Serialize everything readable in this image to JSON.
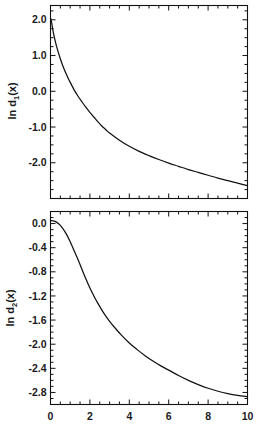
{
  "figure": {
    "title": "",
    "background": "#ffffff",
    "line_color": "#111111",
    "panels": 2
  },
  "chart_data": [
    {
      "id": "panel-top",
      "type": "line",
      "title": "",
      "xlabel": "",
      "ylabel": "ln d1(x)",
      "ylabel_base": "ln d",
      "ylabel_sub": "1",
      "ylabel_tail": "(x)",
      "xlim": [
        0,
        10
      ],
      "ylim": [
        -3.0,
        2.4
      ],
      "grid": false,
      "legend": "none",
      "xticks": [
        0,
        2,
        4,
        6,
        8,
        10
      ],
      "xticklabels": [
        "",
        "",
        "",
        "",
        "",
        ""
      ],
      "xminor_step": 0.5,
      "yticks": [
        2.0,
        1.0,
        0.0,
        -1.0,
        -2.0
      ],
      "yticklabels": [
        "2.0",
        "1.0",
        "0.0",
        "-1.0",
        "-2.0"
      ],
      "yminor_step": 0.25,
      "series": [
        {
          "name": "ln d1(x)",
          "x": [
            0.0,
            0.05,
            0.1,
            0.15,
            0.2,
            0.3,
            0.4,
            0.5,
            0.6,
            0.7,
            0.8,
            0.9,
            1.0,
            1.2,
            1.4,
            1.6,
            1.8,
            2.0,
            2.2,
            2.4,
            2.6,
            2.8,
            3.0,
            3.5,
            4.0,
            4.5,
            5.0,
            5.5,
            6.0,
            6.5,
            7.0,
            7.5,
            8.0,
            8.5,
            9.0,
            9.5,
            10.0
          ],
          "y": [
            2.05,
            1.95,
            1.78,
            1.63,
            1.5,
            1.27,
            1.08,
            0.91,
            0.75,
            0.61,
            0.48,
            0.36,
            0.25,
            0.04,
            -0.14,
            -0.3,
            -0.45,
            -0.59,
            -0.72,
            -0.85,
            -0.97,
            -1.07,
            -1.17,
            -1.37,
            -1.54,
            -1.68,
            -1.8,
            -1.91,
            -2.01,
            -2.1,
            -2.19,
            -2.27,
            -2.35,
            -2.43,
            -2.5,
            -2.57,
            -2.64
          ]
        }
      ]
    },
    {
      "id": "panel-bottom",
      "type": "line",
      "title": "",
      "xlabel": "",
      "ylabel": "ln d2(x)",
      "ylabel_base": "ln d",
      "ylabel_sub": "2",
      "ylabel_tail": "(x)",
      "xlim": [
        0,
        10
      ],
      "ylim": [
        -3.0,
        0.2
      ],
      "grid": false,
      "legend": "none",
      "xticks": [
        0,
        2,
        4,
        6,
        8,
        10
      ],
      "xticklabels": [
        "0",
        "2",
        "4",
        "6",
        "8",
        "10"
      ],
      "xminor_step": 0.5,
      "yticks": [
        0.0,
        -0.4,
        -0.8,
        -1.2,
        -1.6,
        -2.0,
        -2.4,
        -2.8
      ],
      "yticklabels": [
        "0.0",
        "-0.4",
        "-0.8",
        "-1.2",
        "-1.6",
        "-2.0",
        "-2.4",
        "-2.8"
      ],
      "yminor_step": 0.1,
      "series": [
        {
          "name": "ln d2(x)",
          "x": [
            0.0,
            0.2,
            0.4,
            0.6,
            0.8,
            1.0,
            1.2,
            1.4,
            1.6,
            1.8,
            2.0,
            2.2,
            2.4,
            2.6,
            2.8,
            3.0,
            3.3,
            3.6,
            4.0,
            4.4,
            4.8,
            5.2,
            5.6,
            6.0,
            6.5,
            7.0,
            7.5,
            8.0,
            8.5,
            9.0,
            9.5,
            10.0
          ],
          "y": [
            0.05,
            0.04,
            0.0,
            -0.07,
            -0.17,
            -0.3,
            -0.45,
            -0.6,
            -0.76,
            -0.92,
            -1.07,
            -1.2,
            -1.32,
            -1.43,
            -1.53,
            -1.62,
            -1.74,
            -1.85,
            -1.98,
            -2.09,
            -2.19,
            -2.28,
            -2.36,
            -2.43,
            -2.52,
            -2.6,
            -2.67,
            -2.73,
            -2.78,
            -2.82,
            -2.85,
            -2.87
          ]
        }
      ]
    }
  ]
}
